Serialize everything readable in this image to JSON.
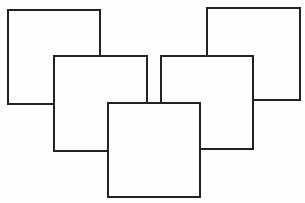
{
  "diagram": {
    "type": "overlapping-squares",
    "background": "#fdfdfd",
    "stroke": "#222222",
    "boxes": [
      {
        "id": "top-left",
        "x": 7,
        "y": 9,
        "w": 94,
        "h": 96
      },
      {
        "id": "top-right",
        "x": 206,
        "y": 7,
        "w": 95,
        "h": 94
      },
      {
        "id": "middle-left",
        "x": 53,
        "y": 55,
        "w": 95,
        "h": 97
      },
      {
        "id": "middle-right",
        "x": 160,
        "y": 55,
        "w": 94,
        "h": 95
      },
      {
        "id": "bottom-center",
        "x": 107,
        "y": 102,
        "w": 94,
        "h": 96
      }
    ]
  }
}
